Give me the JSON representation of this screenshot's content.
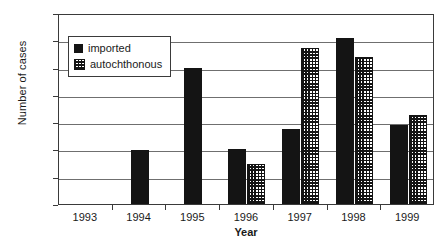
{
  "chart_data": {
    "type": "bar",
    "title": "",
    "xlabel": "Year",
    "ylabel": "Number of cases",
    "categories": [
      "1993",
      "1994",
      "1995",
      "1996",
      "1997",
      "1998",
      "1999"
    ],
    "series": [
      {
        "name": "imported",
        "values": [
          0,
          198,
          497,
          200,
          275,
          610,
          288
        ]
      },
      {
        "name": "autochthonous",
        "values": [
          0,
          0,
          0,
          145,
          570,
          540,
          325
        ]
      }
    ],
    "ylim": [
      0,
      700
    ],
    "ytick_values": [
      0,
      100,
      200,
      300,
      400,
      500,
      600,
      700
    ],
    "ytick_labels": [
      "0",
      "100",
      "200",
      "300",
      "400",
      "500",
      "600",
      "700"
    ],
    "grid": "horizontal",
    "legend_position": "upper-left-inside",
    "colors": {
      "imported": "#141414",
      "autochthonous_fill": "#ffffff",
      "autochthonous_pattern": "#141414",
      "axis": "#3a3a3a",
      "gridline": "#6f6f6f",
      "background": "#ffffff"
    }
  },
  "legend": {
    "items": [
      {
        "label": "imported",
        "style": "solid-black-swatch"
      },
      {
        "label": "autochthonous",
        "style": "checkered-swatch"
      }
    ]
  }
}
